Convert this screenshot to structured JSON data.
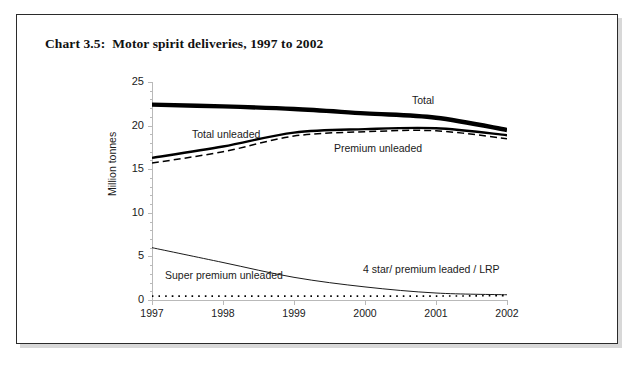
{
  "page": {
    "title_prefix": "Chart 3.5:",
    "title": "Chart 3.5:  Motor spirit deliveries, 1997 to 2002"
  },
  "axes": {
    "y_title": "Million tonnes",
    "y_ticks": [
      "25",
      "20",
      "15",
      "10",
      "5",
      "0"
    ],
    "x_ticks": [
      "1997",
      "1998",
      "1999",
      "2000",
      "2001",
      "2002"
    ]
  },
  "labels": {
    "total": "Total",
    "total_unleaded": "Total unleaded",
    "premium_unleaded": "Premium unleaded",
    "super_premium_unleaded": "Super premium unleaded",
    "four_star": "4 star/ premium leaded / LRP"
  },
  "colors": {
    "frame": "#2b2b2b",
    "axis": "#b9b9b9",
    "line": "#000000",
    "text": "#1a1a1a",
    "background": "#ffffff"
  },
  "chart_data": {
    "type": "line",
    "title": "Chart 3.5:  Motor spirit deliveries, 1997 to 2002",
    "xlabel": "",
    "ylabel": "Million tonnes",
    "x": [
      1997,
      1998,
      1999,
      2000,
      2001,
      2002
    ],
    "xlim": [
      1997,
      2002
    ],
    "ylim": [
      0,
      25
    ],
    "yticks": [
      0,
      5,
      10,
      15,
      20,
      25
    ],
    "grid": false,
    "legend": "inline-annotations",
    "series": [
      {
        "name": "Total",
        "style": "thick-solid",
        "values": [
          22.4,
          22.2,
          21.9,
          21.4,
          20.9,
          19.5
        ]
      },
      {
        "name": "Total unleaded",
        "style": "solid",
        "values": [
          16.3,
          17.6,
          19.2,
          19.6,
          19.7,
          18.9
        ]
      },
      {
        "name": "Premium unleaded",
        "style": "dashed",
        "values": [
          15.7,
          17.0,
          18.8,
          19.3,
          19.4,
          18.5
        ]
      },
      {
        "name": "Super premium unleaded",
        "style": "thin-solid",
        "values": [
          6.0,
          4.3,
          2.6,
          1.5,
          0.8,
          0.6
        ]
      },
      {
        "name": "4 star/ premium leaded / LRP",
        "style": "dotted",
        "values": [
          0.45,
          0.45,
          0.45,
          0.45,
          0.45,
          0.5
        ]
      }
    ]
  }
}
